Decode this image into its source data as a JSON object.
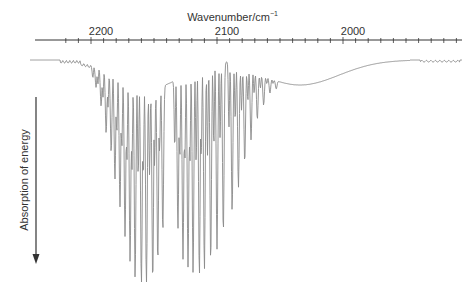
{
  "chart_data": {
    "type": "line",
    "title": "",
    "xlabel": "Wavenumber/cm⁻¹",
    "xlabel_main": "Wavenumber/cm",
    "xlabel_sup": "−1",
    "ylabel": "Absorption of energy",
    "x_axis_position": "top",
    "x_reversed": true,
    "x_ticks": [
      2200,
      2100,
      2000
    ],
    "xlim": [
      2227,
      1880
    ],
    "grid": false,
    "legend": null,
    "y_direction_note": "Downward arrow indicates increasing absorption",
    "annotation": "Rotational-vibrational spectrum with R branch (left) and P branch (right) separated by a gap near 2143 cm⁻¹",
    "series": [
      {
        "name": "R branch",
        "peaks": [
          {
            "x": 2196,
            "depth": 0.1
          },
          {
            "x": 2192,
            "depth": 0.18
          },
          {
            "x": 2188,
            "depth": 0.3
          },
          {
            "x": 2184,
            "depth": 0.38
          },
          {
            "x": 2181,
            "depth": 0.5
          },
          {
            "x": 2177,
            "depth": 0.62
          },
          {
            "x": 2173,
            "depth": 0.75
          },
          {
            "x": 2169,
            "depth": 0.86
          },
          {
            "x": 2165,
            "depth": 0.93
          },
          {
            "x": 2160,
            "depth": 0.97
          },
          {
            "x": 2156,
            "depth": 0.97
          },
          {
            "x": 2151,
            "depth": 0.93
          },
          {
            "x": 2147,
            "depth": 0.84
          },
          {
            "x": 2143,
            "depth": 0.7
          }
        ]
      },
      {
        "name": "P branch",
        "peaks": [
          {
            "x": 2131,
            "depth": 0.72
          },
          {
            "x": 2127,
            "depth": 0.88
          },
          {
            "x": 2123,
            "depth": 0.93
          },
          {
            "x": 2119,
            "depth": 0.97
          },
          {
            "x": 2114,
            "depth": 1.0
          },
          {
            "x": 2110,
            "depth": 0.98
          },
          {
            "x": 2105,
            "depth": 0.96
          },
          {
            "x": 2100,
            "depth": 0.9
          },
          {
            "x": 2095,
            "depth": 0.82
          },
          {
            "x": 2088,
            "depth": 0.7
          },
          {
            "x": 2083,
            "depth": 0.58
          },
          {
            "x": 2078,
            "depth": 0.45
          },
          {
            "x": 2073,
            "depth": 0.33
          },
          {
            "x": 2068,
            "depth": 0.22
          },
          {
            "x": 2063,
            "depth": 0.14
          },
          {
            "x": 2058,
            "depth": 0.07
          },
          {
            "x": 2053,
            "depth": 0.04
          }
        ]
      }
    ]
  },
  "colors": {
    "trace": "#8a8a8a",
    "axis": "#333333",
    "text": "#333333"
  }
}
